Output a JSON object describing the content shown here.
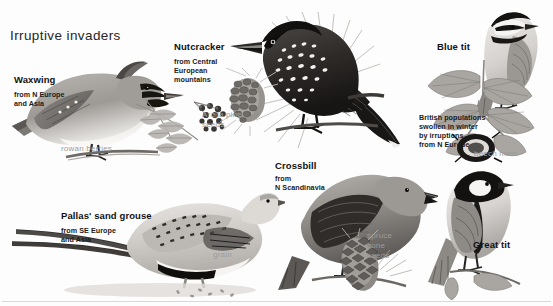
{
  "page": {
    "title": "Irruptive invaders",
    "background_color": "#fdfdfd",
    "text_color": "#1a1a1a",
    "caption_color": "#9a9a9a",
    "width": 553,
    "height": 306
  },
  "species": [
    {
      "id": "waxwing",
      "name": "Waxwing",
      "origin": "from N Europe\nand Asia",
      "food_caption": "rowan berries"
    },
    {
      "id": "nutcracker",
      "name": "Nutcracker",
      "origin": "from Central\nEuropean\nmountains",
      "food_caption": "Arolla pine\nseeds"
    },
    {
      "id": "blue-tit",
      "name": "Blue tit",
      "origin": "British populations\nswollen in winter\nby irruptions\nfrom N Europe",
      "food_caption": "beech mast"
    },
    {
      "id": "pallas-sand-grouse",
      "name": "Pallas' sand grouse",
      "origin": "from SE Europe\nand Asia",
      "food_caption": "grain"
    },
    {
      "id": "crossbill",
      "name": "Crossbill",
      "origin": "from\nN Scandinavia",
      "food_caption": "spruce\ncone\nseeds"
    },
    {
      "id": "great-tit",
      "name": "Great tit",
      "origin": "",
      "food_caption": ""
    }
  ]
}
